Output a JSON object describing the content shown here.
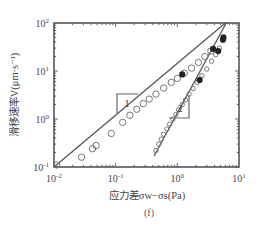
{
  "chart_data": {
    "type": "scatter",
    "title": "",
    "caption": "(f)",
    "xlabel": "应力差σw−σs(Pa)",
    "ylabel": "滑移速率V(μm·s⁻¹)",
    "xscale": "log",
    "yscale": "log",
    "xlim": [
      0.01,
      10
    ],
    "ylim": [
      0.1,
      100
    ],
    "x_ticks": [
      {
        "value": 0.01,
        "base": "10",
        "exp": "-2"
      },
      {
        "value": 0.1,
        "base": "10",
        "exp": "-1"
      },
      {
        "value": 1,
        "base": "10",
        "exp": "0"
      },
      {
        "value": 10,
        "base": "10",
        "exp": "1"
      }
    ],
    "y_ticks": [
      {
        "value": 0.1,
        "base": "10",
        "exp": "-1"
      },
      {
        "value": 1,
        "base": "10",
        "exp": "0"
      },
      {
        "value": 10,
        "base": "10",
        "exp": "1"
      },
      {
        "value": 100,
        "base": "10",
        "exp": "2"
      }
    ],
    "grid": false,
    "series": [
      {
        "name": "1",
        "fit_line": {
          "x": [
            0.01,
            6.0
          ],
          "y": [
            0.1,
            100
          ]
        },
        "open_points": {
          "x": [
            0.011,
            0.028,
            0.042,
            0.048,
            0.085,
            0.13,
            0.17,
            0.22,
            0.28,
            0.35,
            0.45,
            0.6,
            0.8,
            1.0,
            1.3,
            1.7,
            2.2,
            2.8,
            3.5
          ],
          "y": [
            0.11,
            0.16,
            0.24,
            0.28,
            0.5,
            0.85,
            1.2,
            1.6,
            2.1,
            2.6,
            3.3,
            4.4,
            5.8,
            7.0,
            9.0,
            11.5,
            15,
            20,
            26
          ]
        },
        "filled_points": {
          "x": [
            1.2,
            3.8,
            5.5
          ],
          "y": [
            8.5,
            29,
            45
          ]
        }
      },
      {
        "name": "2",
        "fit_line": {
          "x": [
            0.42,
            6.2
          ],
          "y": [
            0.17,
            100
          ]
        },
        "open_points": {
          "x": [
            0.45,
            0.5,
            0.55,
            0.6,
            0.68,
            0.75,
            0.85,
            0.95,
            1.05,
            1.2,
            1.35,
            1.55,
            1.8,
            2.1,
            2.5,
            3.0,
            3.6,
            4.2,
            4.8
          ],
          "y": [
            0.22,
            0.3,
            0.38,
            0.48,
            0.62,
            0.78,
            1.0,
            1.25,
            1.55,
            2.0,
            2.5,
            3.3,
            4.3,
            5.8,
            8.0,
            11,
            16,
            22,
            30
          ]
        },
        "filled_points": {
          "x": [
            2.3,
            4.6,
            5.6
          ],
          "y": [
            6.5,
            26,
            50
          ]
        }
      }
    ],
    "annotations": [
      {
        "text": "1",
        "target_series": "1"
      },
      {
        "text": "2",
        "target_series": "2"
      }
    ],
    "colors": {
      "frame": "#555555",
      "line": "#555555",
      "marker_open": "#777777",
      "marker_filled": "#222222"
    }
  }
}
